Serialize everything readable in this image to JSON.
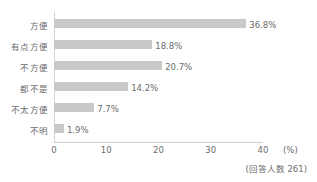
{
  "chart_data": {
    "type": "bar",
    "orientation": "horizontal",
    "title": "",
    "subtitle": "",
    "xlabel": "(%)",
    "ylabel": "",
    "xlim": [
      0,
      40
    ],
    "xticks": [
      0,
      10,
      20,
      30,
      40
    ],
    "xtick_labels": [
      "0",
      "10",
      "20",
      "30",
      "40"
    ],
    "grid": false,
    "legend": null,
    "categories": [
      "方便",
      "有点方便",
      "不方便",
      "都不是",
      "不太方便",
      "不明"
    ],
    "values": [
      36.8,
      20.7,
      14.2,
      7.7,
      1.9,
      18.8
    ],
    "bars": [
      {
        "category": "方便",
        "value": 36.8,
        "label": "36.8%"
      },
      {
        "category": "有点方便",
        "value": 18.8,
        "label": "18.8%"
      },
      {
        "category": "不方便",
        "value": 20.7,
        "label": "20.7%"
      },
      {
        "category": "都不是",
        "value": 14.2,
        "label": "14.2%"
      },
      {
        "category": "不太方便",
        "value": 7.7,
        "label": "7.7%"
      },
      {
        "category": "不明",
        "value": 1.9,
        "label": "1.9%"
      }
    ],
    "annotations": [
      "(回答人数 261)"
    ],
    "bar_color": "#c9c9c9",
    "text_color": "#6b6b6b",
    "axis_color": "#d2d2d2",
    "background": "#ffffff"
  },
  "axis": {
    "unit": "(%)",
    "ticks": [
      "0",
      "10",
      "20",
      "30",
      "40"
    ]
  },
  "footnote": {
    "text": "(回答人数 261)"
  }
}
